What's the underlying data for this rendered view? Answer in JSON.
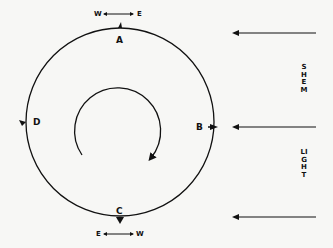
{
  "diagram": {
    "points": {
      "a": "A",
      "b": "B",
      "c": "C",
      "d": "D"
    },
    "top_direction": {
      "left": "W",
      "right": "E"
    },
    "bottom_direction": {
      "left": "E",
      "right": "W"
    },
    "side_labels": {
      "upper": "SHEM",
      "lower": "LIGHT"
    },
    "colors": {
      "ink": "#111111",
      "background": "#f7f7f5"
    }
  }
}
